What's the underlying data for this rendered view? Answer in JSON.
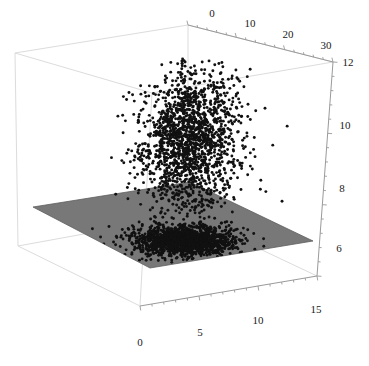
{
  "figure": {
    "kind": "3d-scatter-with-plane",
    "background_color": "#ffffff",
    "frame_color": "#d8d8d8",
    "axis_line_color": "#8a8a8a",
    "point_color": "#111111",
    "plane_color": "#7a7a7a",
    "plane_edge_color": "#5e5e5e",
    "tick_label_color": "#1a1a1a"
  },
  "axes": {
    "x": {
      "name": "x-axis-bottom-front",
      "ticks": [
        "0",
        "5",
        "10",
        "15"
      ],
      "tick_values": [
        0,
        5,
        10,
        15
      ],
      "range": [
        -1.5,
        18.5
      ],
      "minor_ticks_per_interval": 4
    },
    "y": {
      "name": "y-axis-top-back",
      "ticks": [
        "0",
        "10",
        "20",
        "30"
      ],
      "tick_values": [
        0,
        10,
        20,
        30
      ],
      "range": [
        -4,
        36
      ],
      "minor_ticks_per_interval": 4
    },
    "z": {
      "name": "z-axis-right-vertical",
      "ticks": [
        "12",
        "10",
        "8",
        "6"
      ],
      "tick_values": [
        12,
        10,
        8,
        6
      ],
      "range": [
        5.2,
        12.6
      ],
      "minor_ticks_per_interval": 4
    }
  },
  "chart_data": {
    "type": "scatter",
    "title": "",
    "xlabel": "",
    "ylabel": "",
    "zlabel": "",
    "grid": false,
    "legend": null,
    "axis_ranges": {
      "x": [
        -1.5,
        18.5
      ],
      "y": [
        -4,
        36
      ],
      "z": [
        5.2,
        12.6
      ]
    },
    "tick_labels": {
      "x": [
        "0",
        "5",
        "10",
        "15"
      ],
      "y": [
        "0",
        "10",
        "20",
        "30"
      ],
      "z": [
        "12",
        "10",
        "8",
        "6"
      ]
    },
    "series": [
      {
        "name": "point-cloud-3d",
        "marker": "filled-circle",
        "color": "#111111",
        "n_points": 1800,
        "description": "dense vertically elongated cloud suspended in the box, centered high-right",
        "center": {
          "x": 7.0,
          "y": 7.0,
          "z": 10.0
        },
        "spread": {
          "x": 2.4,
          "y": 4.2,
          "z": 1.25
        }
      },
      {
        "name": "point-cloud-plane-projection",
        "marker": "filled-circle",
        "color": "#111111",
        "n_points": 1500,
        "description": "same cloud projected flat onto the gray reference plane at the base",
        "center": {
          "x": 7.0,
          "y": 7.0,
          "z": 6.45
        },
        "spread": {
          "x": 2.4,
          "y": 4.2,
          "z": 0.0
        }
      },
      {
        "name": "reference-plane",
        "type": "surface",
        "color": "#7a7a7a",
        "z_value": 6.45,
        "description": "flat opaque gray horizontal plane spanning the full x-y extent of the box"
      }
    ]
  },
  "geometry": {
    "box_corners_px": {
      "back_top_left": [
        15,
        53
      ],
      "back_top_right": [
        188,
        25
      ],
      "front_top_right": [
        333,
        62
      ],
      "front_top_left": [
        152,
        93
      ],
      "back_bottom_left": [
        18,
        246
      ],
      "back_bottom_right": [
        188,
        215
      ],
      "front_bottom_right": [
        317,
        276
      ],
      "front_bottom_left": [
        140,
        306
      ]
    },
    "plane_corners_px": {
      "left": [
        33,
        207
      ],
      "back": [
        190,
        182
      ],
      "right": [
        313,
        241
      ],
      "front": [
        150,
        268
      ]
    }
  }
}
